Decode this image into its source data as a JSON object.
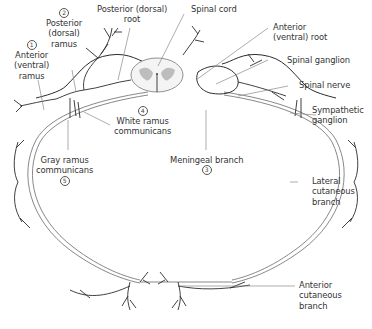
{
  "figure": {
    "colors": {
      "nerve_line": "#2b2b2b",
      "leader_line": "#8a8a8a",
      "gray_matter": "#bdbdbd",
      "text": "#333333"
    }
  },
  "labels": {
    "posterior_root": {
      "line1": "Posterior (dorsal)",
      "line2": "root"
    },
    "spinal_cord": {
      "line1": "Spinal cord"
    },
    "posterior_ramus": {
      "number": "2",
      "line1": "Posterior",
      "line2": "(dorsal)",
      "line3": "ramus"
    },
    "anterior_ramus": {
      "number": "1",
      "line1": "Anterior",
      "line2": "(ventral)",
      "line3": "ramus"
    },
    "anterior_root": {
      "line1": "Anterior",
      "line2": "(ventral) root"
    },
    "spinal_ganglion": {
      "line1": "Spinal ganglion"
    },
    "spinal_nerve": {
      "line1": "Spinal nerve"
    },
    "sympathetic_ganglion": {
      "line1": "Sympathetic",
      "line2": "ganglion"
    },
    "white_ramus": {
      "number": "4",
      "line1": "White ramus",
      "line2": "communicans"
    },
    "gray_ramus": {
      "number": "5",
      "line1": "Gray ramus",
      "line2": "communicans"
    },
    "meningeal_branch": {
      "number": "3",
      "line1": "Meningeal branch"
    },
    "lateral_cutaneous": {
      "line1": "Lateral",
      "line2": "cutaneous",
      "line3": "branch"
    },
    "anterior_cutaneous": {
      "line1": "Anterior",
      "line2": "cutaneous",
      "line3": "branch"
    }
  }
}
